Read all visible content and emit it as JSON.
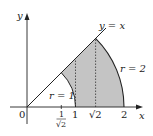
{
  "figure": {
    "type": "polar-region-diagram",
    "colors": {
      "shade": "#c4c4c4",
      "stroke": "#222222",
      "dotted": "#333333",
      "background": "#ffffff"
    },
    "axes": {
      "x_label": "x",
      "y_label": "y",
      "origin_label": "0"
    },
    "x_ticks": [
      {
        "value": 0.7071,
        "label_num": "1",
        "label_den": "√2"
      },
      {
        "value": 1,
        "label": "1"
      },
      {
        "value": 1.4142,
        "label": "√2"
      },
      {
        "value": 2,
        "label": "2"
      }
    ],
    "curves": {
      "line_label": "y = x",
      "inner_arc_label": "r = 1",
      "outer_arc_label": "r = 2"
    },
    "region": {
      "description": "Shaded region between r = 1 and r = 2 for 0 ≤ θ ≤ π/4",
      "theta_min": "0",
      "theta_max": "π/4"
    },
    "dotted_verticals_at": [
      1,
      1.4142
    ]
  }
}
